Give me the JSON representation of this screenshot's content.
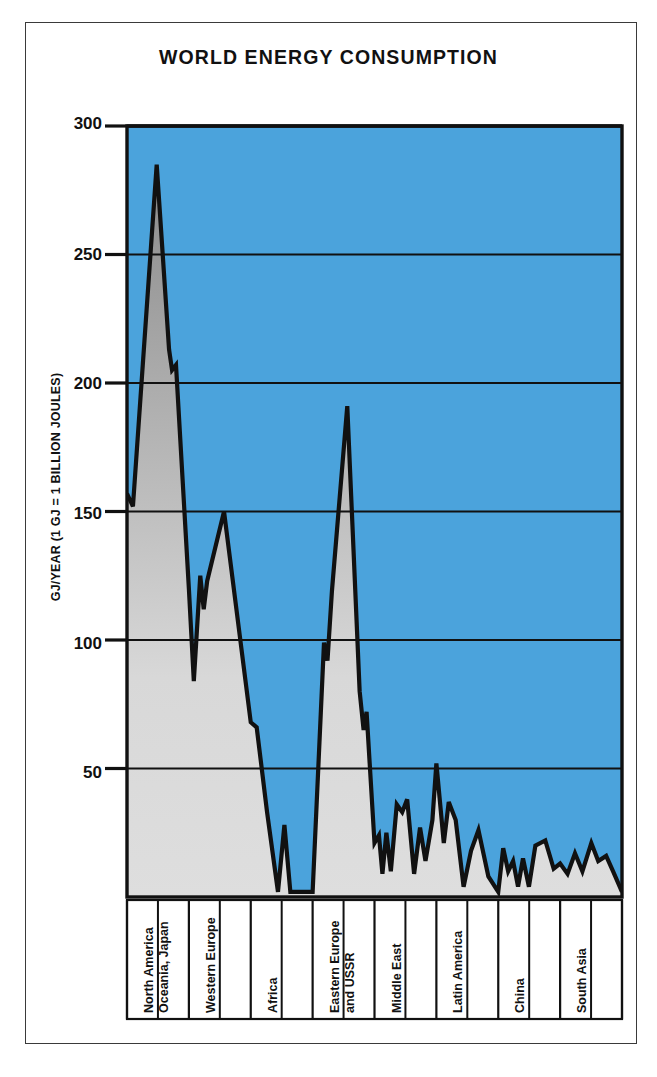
{
  "title": "WORLD ENERGY CONSUMPTION",
  "colors": {
    "sky": "#4ba3dc",
    "fill_light": "#d9d9d9",
    "fill_dark": "#878787",
    "line": "#111111",
    "frame": "#3a3a3a",
    "background": "#ffffff"
  },
  "axes": {
    "ylabel": "GJ/YEAR (1 GJ = 1 BILLION JOULES)",
    "yticks": [
      "300",
      "250",
      "200",
      "150",
      "100",
      "50"
    ],
    "ytick_values": [
      300,
      250,
      200,
      150,
      100,
      50
    ],
    "ymin": 0,
    "ymax": 300,
    "grid": "horizontal"
  },
  "regions": [
    {
      "label": "North America\nOceania, Japan",
      "line1": "North America",
      "line2": "Oceania, Japan"
    },
    {
      "label": "Western Europe",
      "line1": "Western Europe",
      "line2": ""
    },
    {
      "label": "Africa",
      "line1": "Africa",
      "line2": ""
    },
    {
      "label": "Eastern Europe\nand USSR",
      "line1": "Eastern Europe",
      "line2": "and USSR"
    },
    {
      "label": "Middle East",
      "line1": "Middle East",
      "line2": ""
    },
    {
      "label": "Latin America",
      "line1": "Latin America",
      "line2": ""
    },
    {
      "label": "China",
      "line1": "China",
      "line2": ""
    },
    {
      "label": "South Asia",
      "line1": "South Asia",
      "line2": ""
    }
  ],
  "chart_data": {
    "type": "area",
    "title": "WORLD ENERGY CONSUMPTION",
    "xlabel": "",
    "ylabel": "GJ/YEAR (1 GJ = 1 BILLION JOULES)",
    "ylim": [
      0,
      300
    ],
    "yticks": [
      50,
      100,
      150,
      200,
      250,
      300
    ],
    "grid": true,
    "legend": "none",
    "note": "Per-capita energy consumption per country, countries ordered by region and descending consumption. Filled area under a jagged line; sky-blue above the curve, gray below.",
    "region_boundaries_x_fraction": [
      0.0,
      0.125,
      0.25,
      0.375,
      0.5,
      0.625,
      0.75,
      0.875,
      1.0
    ],
    "series": [
      {
        "name": "Energy consumption per capita (GJ/year)",
        "points": [
          {
            "x": 0.0,
            "y": 157
          },
          {
            "x": 0.012,
            "y": 152
          },
          {
            "x": 0.06,
            "y": 285
          },
          {
            "x": 0.085,
            "y": 213
          },
          {
            "x": 0.091,
            "y": 205
          },
          {
            "x": 0.099,
            "y": 207
          },
          {
            "x": 0.125,
            "y": 120
          },
          {
            "x": 0.135,
            "y": 84
          },
          {
            "x": 0.148,
            "y": 125
          },
          {
            "x": 0.155,
            "y": 112
          },
          {
            "x": 0.162,
            "y": 123
          },
          {
            "x": 0.196,
            "y": 150
          },
          {
            "x": 0.25,
            "y": 68
          },
          {
            "x": 0.262,
            "y": 66
          },
          {
            "x": 0.283,
            "y": 33
          },
          {
            "x": 0.305,
            "y": 2
          },
          {
            "x": 0.318,
            "y": 28
          },
          {
            "x": 0.33,
            "y": 2
          },
          {
            "x": 0.375,
            "y": 2
          },
          {
            "x": 0.398,
            "y": 99
          },
          {
            "x": 0.405,
            "y": 92
          },
          {
            "x": 0.414,
            "y": 119
          },
          {
            "x": 0.445,
            "y": 191
          },
          {
            "x": 0.47,
            "y": 80
          },
          {
            "x": 0.478,
            "y": 65
          },
          {
            "x": 0.484,
            "y": 72
          },
          {
            "x": 0.5,
            "y": 21
          },
          {
            "x": 0.509,
            "y": 24
          },
          {
            "x": 0.516,
            "y": 9
          },
          {
            "x": 0.524,
            "y": 25
          },
          {
            "x": 0.533,
            "y": 10
          },
          {
            "x": 0.545,
            "y": 36
          },
          {
            "x": 0.556,
            "y": 33
          },
          {
            "x": 0.566,
            "y": 38
          },
          {
            "x": 0.58,
            "y": 9
          },
          {
            "x": 0.592,
            "y": 27
          },
          {
            "x": 0.603,
            "y": 14
          },
          {
            "x": 0.617,
            "y": 30
          },
          {
            "x": 0.625,
            "y": 52
          },
          {
            "x": 0.64,
            "y": 21
          },
          {
            "x": 0.65,
            "y": 37
          },
          {
            "x": 0.664,
            "y": 30
          },
          {
            "x": 0.68,
            "y": 4
          },
          {
            "x": 0.695,
            "y": 18
          },
          {
            "x": 0.71,
            "y": 26
          },
          {
            "x": 0.73,
            "y": 8
          },
          {
            "x": 0.75,
            "y": 2
          },
          {
            "x": 0.76,
            "y": 19
          },
          {
            "x": 0.77,
            "y": 10
          },
          {
            "x": 0.78,
            "y": 14
          },
          {
            "x": 0.79,
            "y": 4
          },
          {
            "x": 0.8,
            "y": 15
          },
          {
            "x": 0.812,
            "y": 4
          },
          {
            "x": 0.825,
            "y": 20
          },
          {
            "x": 0.845,
            "y": 22
          },
          {
            "x": 0.862,
            "y": 11
          },
          {
            "x": 0.875,
            "y": 13
          },
          {
            "x": 0.89,
            "y": 9
          },
          {
            "x": 0.905,
            "y": 17
          },
          {
            "x": 0.92,
            "y": 10
          },
          {
            "x": 0.938,
            "y": 21
          },
          {
            "x": 0.952,
            "y": 14
          },
          {
            "x": 0.968,
            "y": 16
          },
          {
            "x": 0.982,
            "y": 10
          },
          {
            "x": 1.0,
            "y": 2
          }
        ]
      }
    ]
  }
}
